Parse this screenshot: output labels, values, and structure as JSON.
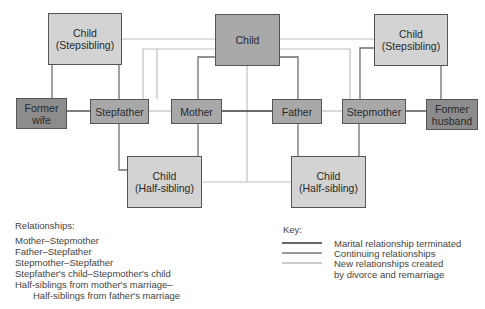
{
  "nodes": {
    "child_stepsibling_left": {
      "line1": "Child",
      "line2": "(Stepsibling)"
    },
    "child_center": {
      "label": "Child"
    },
    "child_stepsibling_right": {
      "line1": "Child",
      "line2": "(Stepsibling)"
    },
    "former_wife": {
      "line1": "Former",
      "line2": "wife"
    },
    "stepfather": {
      "label": "Stepfather"
    },
    "mother": {
      "label": "Mother"
    },
    "father": {
      "label": "Father"
    },
    "stepmother": {
      "label": "Stepmother"
    },
    "former_husband": {
      "line1": "Former",
      "line2": "husband"
    },
    "child_halfsibling_left": {
      "line1": "Child",
      "line2": "(Half-sibling)"
    },
    "child_halfsibling_right": {
      "line1": "Child",
      "line2": "(Half-sibling)"
    }
  },
  "relationships": {
    "title": "Relationships:",
    "items": [
      "Mother–Stepmother",
      "Father–Stepfather",
      "Stepmother–Stepfather",
      "Stepfather's child–Stepmother's child",
      "Half-siblings from mother's marriage–"
    ],
    "continuation": "Half-siblings from father's marriage"
  },
  "key": {
    "title": "Key:",
    "items": [
      {
        "label": "Marital relationship terminated",
        "color": "#333333"
      },
      {
        "label": "Continuing relationships",
        "color": "#777777"
      },
      {
        "label": "New relationships created",
        "color": "#bbbbbb"
      }
    ],
    "continuation": "by divorce and remarriage"
  },
  "colors": {
    "terminated": "#333333",
    "continuing": "#777777",
    "new": "#bbbbbb",
    "box_light": "#d3d3d3",
    "box_mid": "#a8a8a8",
    "box_dark": "#8c8c8c"
  }
}
